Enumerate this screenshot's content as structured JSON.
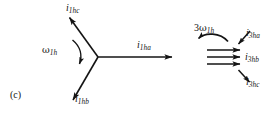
{
  "figure": {
    "panel_label": "(c)",
    "caption_note": "",
    "background_color": "#ffffff",
    "ink_color": "#141414"
  },
  "phasor_star": {
    "name": "fundamental-harmonic-phasor-star",
    "center": {
      "x": 98,
      "y": 57
    },
    "vectors": [
      {
        "id": "i1hc",
        "label_i": "i",
        "label_sub": "1hc",
        "angle_deg": 125,
        "length": 57,
        "label_x": 66,
        "label_y": 3
      },
      {
        "id": "i1ha",
        "label_i": "i",
        "label_sub": "1ha",
        "angle_deg": 0,
        "length": 75,
        "label_x": 137,
        "label_y": 40
      },
      {
        "id": "i1hb",
        "label_i": "i",
        "label_sub": "1hb",
        "angle_deg": 242,
        "length": 53,
        "label_x": 75,
        "label_y": 94
      }
    ],
    "rotation_marker": {
      "id": "omega-1h",
      "label_om": "ω",
      "label_sub": "1h",
      "label_x": 42,
      "label_y": 45,
      "direction": "clockwise-arrowhead-bottom"
    }
  },
  "third_harmonic_group": {
    "name": "third-harmonic-parallel-arrows",
    "arrows": [
      {
        "id": "i3ha",
        "y": 50,
        "x_start": 207,
        "x_end": 241
      },
      {
        "id": "i3hb",
        "y": 57,
        "x_start": 207,
        "x_end": 241
      },
      {
        "id": "i3hc",
        "y": 64,
        "x_start": 207,
        "x_end": 241
      }
    ],
    "labels": [
      {
        "id": "i3ha",
        "label_i": "i",
        "label_sub": "3ha",
        "x": 246,
        "y": 28
      },
      {
        "id": "i3hb",
        "label_i": "i",
        "label_sub": "3hb",
        "x": 245,
        "y": 52
      },
      {
        "id": "i3hc",
        "label_i": "i",
        "label_sub": "3hc",
        "x": 246,
        "y": 77
      }
    ],
    "rotation_marker": {
      "id": "three-omega-1h",
      "label_num": "3",
      "label_om": "ω",
      "label_sub": "1h",
      "label_x": 194,
      "label_y": 23,
      "direction": "arrowhead-left"
    }
  }
}
